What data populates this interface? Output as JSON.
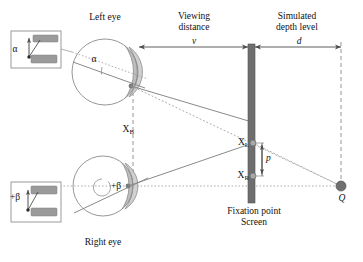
{
  "figure": {
    "title_implicit": "Stereoscopic viewing geometry",
    "labels": {
      "left_eye": "Left eye",
      "right_eye": "Right eye",
      "viewing_distance": "Viewing\ndistance",
      "viewing_distance_symbol": "v",
      "simulated_depth": "Simulated\ndepth level",
      "simulated_depth_symbol": "d",
      "fixation_point": "Fixation point",
      "screen": "Screen",
      "alpha": "α",
      "alpha_inset": "α",
      "beta": "+β",
      "beta_inset": "+β",
      "xb": "X",
      "xb_sub": "B",
      "xl": "X",
      "xl_sub": "L",
      "xr": "X",
      "xr_sub": "R",
      "parallax": "p",
      "q_point": "Q"
    },
    "colors": {
      "line": "#8a8a8a",
      "screen_fill": "#6e6e6e",
      "lens_fill": "#b9b9b9",
      "bar_fill": "#9a9a9a",
      "dot_fill": "#6e6e6e",
      "q_fill": "#707070",
      "text": "#1a1a1a",
      "background": "#ffffff"
    },
    "geometry": {
      "left_eye_center": [
        105,
        72
      ],
      "left_eye_radius": 33,
      "right_eye_center": [
        103,
        186
      ],
      "right_eye_radius": 30,
      "screen_x": 251,
      "screen_top_y": 44,
      "screen_bottom_y": 203,
      "q_point": [
        341,
        186
      ],
      "xl_point": [
        253,
        143
      ],
      "xr_point": [
        253,
        176
      ],
      "xb_dashed_x": 133
    }
  }
}
